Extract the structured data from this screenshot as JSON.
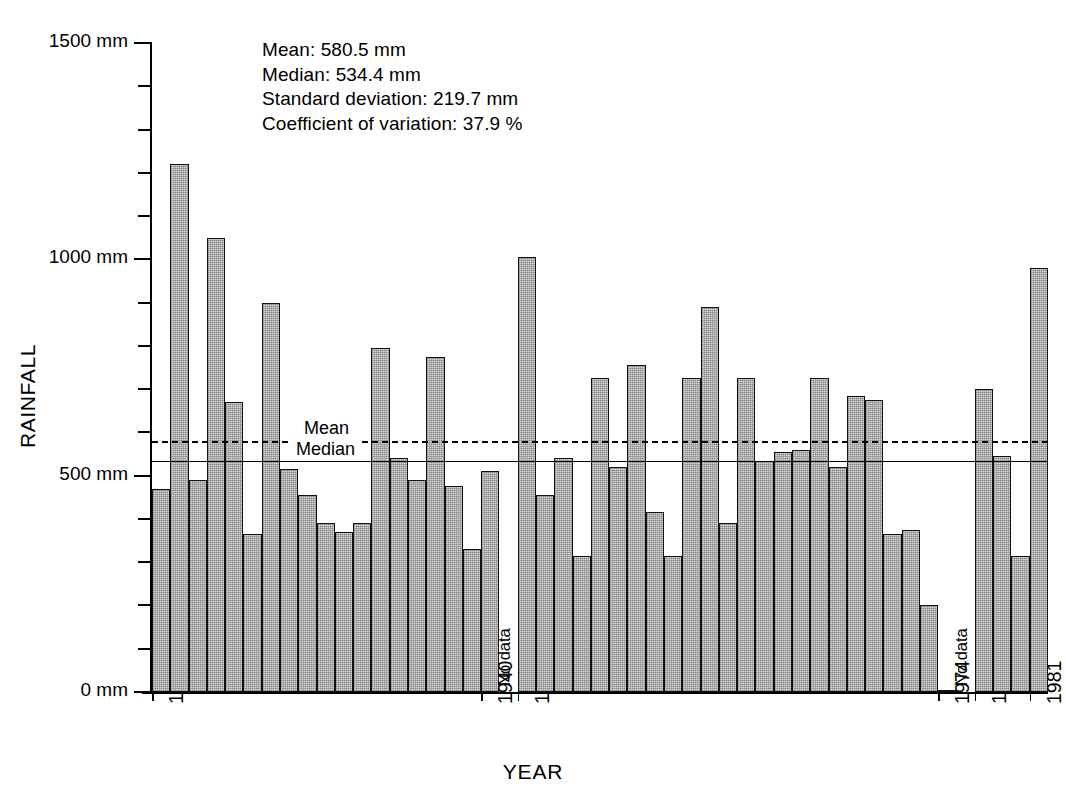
{
  "chart_data": {
    "type": "bar",
    "title": "",
    "xlabel": "YEAR",
    "ylabel": "RAINFALL",
    "ylim": [
      0,
      1500
    ],
    "yunit": "mm",
    "grid": false,
    "legend_position": "inline-on-lines",
    "y_tick_labels": [
      "0 mm",
      "500 mm",
      "1000 mm",
      "1500 mm"
    ],
    "y_tick_values": [
      0,
      500,
      1000,
      1500
    ],
    "y_minor_tick_step": 100,
    "x_tick_labels": [
      "1922",
      "1940",
      "1951",
      "1974",
      "1978",
      "1981"
    ],
    "categories": [
      "1922",
      "1923",
      "1924",
      "1925",
      "1926",
      "1927",
      "1928",
      "1929",
      "1930",
      "1931",
      "1932",
      "1933",
      "1934",
      "1935",
      "1936",
      "1937",
      "1938",
      "1939",
      "1940",
      "No data",
      "1951",
      "1952",
      "1953",
      "1954",
      "1955",
      "1956",
      "1957",
      "1958",
      "1959",
      "1960",
      "1961",
      "1962",
      "1963",
      "1964",
      "1965",
      "1966",
      "1967",
      "1968",
      "1969",
      "1970",
      "1971",
      "1972",
      "1973",
      "1974",
      "No data",
      "1978",
      "1979",
      "1980",
      "1981"
    ],
    "values": [
      470,
      1220,
      490,
      1050,
      670,
      365,
      900,
      515,
      455,
      390,
      370,
      390,
      795,
      540,
      490,
      775,
      475,
      330,
      510,
      null,
      1005,
      455,
      540,
      315,
      725,
      520,
      755,
      415,
      315,
      725,
      890,
      390,
      725,
      535,
      555,
      560,
      725,
      520,
      685,
      675,
      365,
      375,
      200,
      0,
      null,
      700,
      545,
      315,
      980
    ],
    "annotations": [
      {
        "name": "mean-line",
        "label": "Mean",
        "value": 580.5,
        "style": "dashed"
      },
      {
        "name": "median-line",
        "label": "Median",
        "value": 534.4,
        "style": "solid"
      },
      {
        "name": "no-data-gap-1",
        "label": "No data",
        "after_category": "1940"
      },
      {
        "name": "no-data-gap-2",
        "label": "No data",
        "after_category": "1974"
      }
    ]
  },
  "stats": {
    "mean": "Mean:  580.5 mm",
    "median": "Median:  534.4 mm",
    "std_dev": "Standard deviation:  219.7 mm",
    "coef_var": "Coefficient of variation:  37.9 %"
  },
  "axis_labels": {
    "y_title": "RAINFALL",
    "x_title": "YEAR"
  },
  "line_labels": {
    "mean": "Mean",
    "median": "Median"
  },
  "no_data_label": "No data"
}
